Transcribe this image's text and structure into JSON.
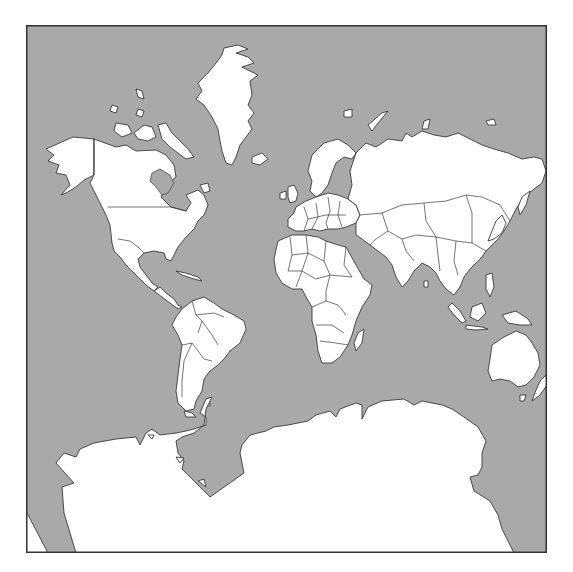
{
  "map": {
    "projection": "mercator",
    "colors": {
      "ocean": "#a9a9a9",
      "land": "#ffffff",
      "border": "#3a3a3a",
      "frame": "#333333"
    },
    "frame": {
      "x": 26,
      "y": 25,
      "width": 521,
      "height": 528
    },
    "regions": [
      "north-america",
      "greenland",
      "south-america",
      "europe",
      "africa",
      "asia",
      "australia",
      "antarctica",
      "arctic-islands",
      "madagascar",
      "new-zealand",
      "indonesia",
      "japan",
      "uk-ireland",
      "iceland"
    ]
  }
}
